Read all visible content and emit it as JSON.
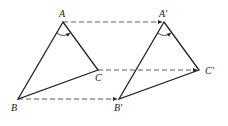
{
  "diagram": {
    "title": "",
    "labels": {
      "A": "A",
      "B": "B",
      "C": "C",
      "A_prime": "A′",
      "B_prime": "B′",
      "C_prime": "C′"
    },
    "points": {
      "A": [
        63,
        22
      ],
      "B": [
        18,
        99
      ],
      "C": [
        98,
        70
      ],
      "A_prime": [
        164,
        22
      ],
      "B_prime": [
        119,
        99
      ],
      "C_prime": [
        199,
        70
      ]
    },
    "translation_vector": [
      101,
      0
    ],
    "colors": {
      "stroke": "#222222",
      "background": "#ffffff"
    }
  }
}
